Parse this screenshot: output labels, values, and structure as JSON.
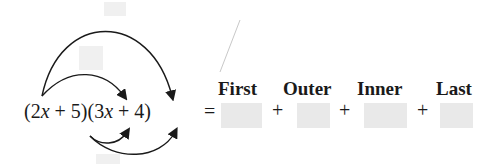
{
  "expression": {
    "left_factor": "(2x + 5)",
    "right_factor": "(3x + 4)",
    "equals": "="
  },
  "labels": [
    "First",
    "Outer",
    "Inner",
    "Last"
  ],
  "blanks": [
    "",
    "",
    "",
    ""
  ],
  "operators": [
    "+",
    "+",
    "+"
  ],
  "arrows": [
    {
      "name": "first",
      "from": "2x",
      "to": "3x"
    },
    {
      "name": "outer",
      "from": "2x",
      "to": "4"
    },
    {
      "name": "inner",
      "from": "5",
      "to": "3x"
    },
    {
      "name": "last",
      "from": "5",
      "to": "4"
    }
  ],
  "colors": {
    "blank_fill": "#e9e9e9",
    "ink": "#1a1a1a"
  }
}
